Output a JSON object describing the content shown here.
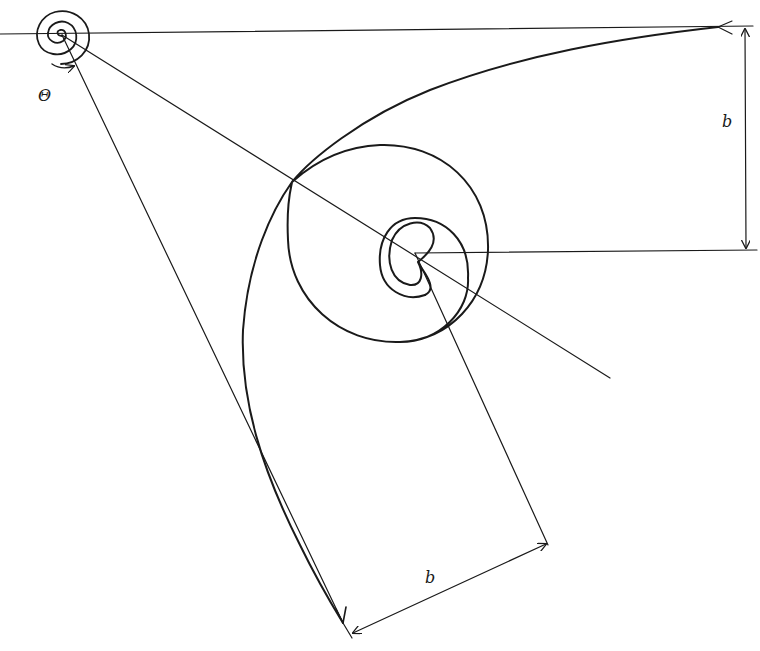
{
  "diagram": {
    "stroke_color": "#1a1a1a",
    "background": "#ffffff",
    "labels": {
      "theta": "Θ",
      "b_vertical": "b",
      "b_bottom": "b"
    },
    "elements": [
      "small-spiral-origin",
      "rotation-arrow-theta",
      "horizontal-reference-line",
      "main-spiral-curve",
      "radial-line-to-right",
      "radial-line-to-bottom",
      "inner-horizontal-line",
      "inner-radial-line",
      "vertical-dimension-b",
      "bottom-dimension-b"
    ]
  }
}
